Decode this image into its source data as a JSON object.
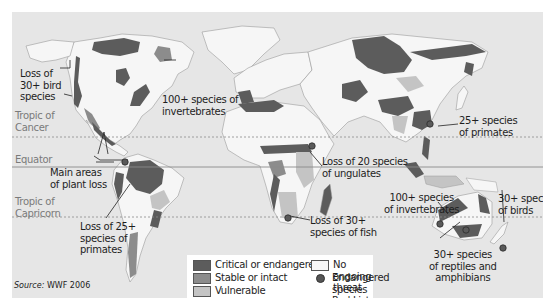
{
  "colors": {
    "ocean": "#e6e6e6",
    "critical": "#5c5c5c",
    "stable": "#8c8c8c",
    "vulnerable": "#c4c4c4",
    "no_threat": "#f6f6f6",
    "hotspot": "#5a5a5a",
    "border": "#9a9a9a",
    "lat_line": "#8a8a8a"
  },
  "latitude_lines": {
    "tropic_cancer": {
      "label_line1": "Tropic of",
      "label_line2": "Cancer"
    },
    "equator": {
      "label": "Equator"
    },
    "tropic_capricorn": {
      "label_line1": "Tropic of",
      "label_line2": "Capricorn"
    }
  },
  "annotations": {
    "bird_loss_na": {
      "line1": "Loss of",
      "line2": "30+ bird",
      "line3": "species"
    },
    "invertebrates_med": {
      "line1": "100+ species of",
      "line2": "invertebrates"
    },
    "primates_asia": {
      "line1": "25+ species",
      "line2": "of primates"
    },
    "plant_loss": {
      "line1": "Main areas",
      "line2": "of plant loss"
    },
    "ungulates": {
      "line1": "Loss of 20 species",
      "line2": "of ungulates"
    },
    "invertebrates_aus": {
      "line1": "100+ species",
      "line2": "of invertebrates"
    },
    "birds_nz": {
      "line1": "30+ species",
      "line2": "of birds"
    },
    "primates_sa": {
      "line1": "Loss of 25+",
      "line2": "species of",
      "line3": "primates"
    },
    "fish": {
      "line1": "Loss of 30+",
      "line2": "species of fish"
    },
    "reptiles": {
      "line1": "30+ species",
      "line2": "of reptiles and",
      "line3": "amphibians"
    }
  },
  "legend": {
    "items": [
      {
        "label": "Critical or endangered",
        "type": "swatch",
        "color": "#5c5c5c"
      },
      {
        "label": "Stable or intact",
        "type": "swatch",
        "color": "#8c8c8c"
      },
      {
        "label": "Vulnerable",
        "type": "swatch",
        "color": "#c4c4c4"
      },
      {
        "label": "No ongoing threat",
        "type": "swatch",
        "color": "#f6f6f6"
      },
      {
        "label": "Endangered species",
        "label2": "Red List hotspot",
        "type": "dot",
        "color": "#5a5a5a"
      }
    ]
  },
  "source": {
    "prefix": "Source:",
    "text": "WWF 2006"
  }
}
